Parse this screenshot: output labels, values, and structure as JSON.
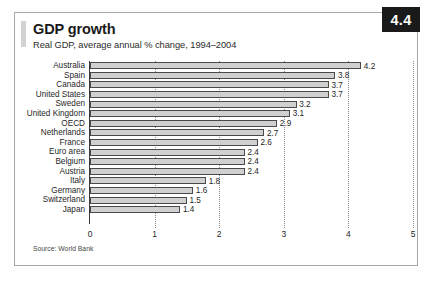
{
  "figure": {
    "badge": "4.4",
    "title": "GDP growth",
    "subtitle": "Real GDP, average annual % change, 1994–2004",
    "source": "Source: World Bank"
  },
  "chart_data": {
    "type": "bar",
    "orientation": "horizontal",
    "title": "GDP growth",
    "subtitle": "Real GDP, average annual % change, 1994–2004",
    "xlabel": "",
    "ylabel": "",
    "xlim": [
      0,
      5
    ],
    "xticks": [
      "0",
      "1",
      "2",
      "3",
      "4",
      "5"
    ],
    "grid": "vertical-dotted",
    "legend": "none",
    "categories": [
      "Australia",
      "Spain",
      "Canada",
      "United States",
      "Sweden",
      "United Kingdom",
      "OECD",
      "Netherlands",
      "France",
      "Euro area",
      "Belgium",
      "Austria",
      "Italy",
      "Germany",
      "Switzerland",
      "Japan"
    ],
    "values": [
      4.2,
      3.8,
      3.7,
      3.7,
      3.2,
      3.1,
      2.9,
      2.7,
      2.6,
      2.4,
      2.4,
      2.4,
      1.8,
      1.6,
      1.5,
      1.4
    ],
    "value_labels": [
      "4.2",
      "3.8",
      "3.7",
      "3.7",
      "3.2",
      "3.1",
      "2.9",
      "2.7",
      "2.6",
      "2.4",
      "2.4",
      "2.4",
      "1.8",
      "1.6",
      "1.5",
      "1.4"
    ],
    "colors": {
      "bar_fill": "#d0d0d0",
      "bar_border": "#4a4a4a",
      "badge_bg": "#1a1a1a",
      "text": "#1f1f1f"
    }
  }
}
